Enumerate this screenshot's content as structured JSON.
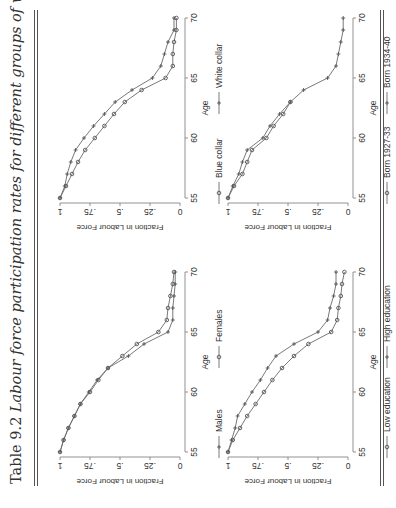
{
  "title": {
    "number": "Table 9.2",
    "caption": "Labour force participation rates for different groups of workers"
  },
  "colors": {
    "line": "#6a6a6a",
    "marker": "#555555",
    "axis": "#777777",
    "text": "#333333"
  },
  "chart_data": [
    {
      "id": "gender",
      "type": "line",
      "title": "",
      "xlabel": "Age",
      "ylabel": "Fraction in Labour Force",
      "x": [
        55,
        56,
        57,
        58,
        59,
        60,
        61,
        62,
        63,
        64,
        65,
        66,
        67,
        68,
        69,
        70
      ],
      "xticks": [
        55,
        60,
        65,
        70
      ],
      "yticks": [
        0,
        0.25,
        0.5,
        0.75,
        1
      ],
      "ytick_labels": [
        "0",
        ".25",
        ".5",
        ".75",
        "1"
      ],
      "ylim": [
        0,
        1
      ],
      "legend_position": "bottom",
      "series": [
        {
          "name": "Males",
          "marker": "cross",
          "values": [
            1.0,
            0.97,
            0.93,
            0.88,
            0.83,
            0.76,
            0.69,
            0.6,
            0.43,
            0.3,
            0.1,
            0.06,
            0.06,
            0.05,
            0.04,
            0.04
          ]
        },
        {
          "name": "Females",
          "marker": "circle",
          "values": [
            1.0,
            0.97,
            0.93,
            0.88,
            0.83,
            0.75,
            0.68,
            0.6,
            0.48,
            0.36,
            0.18,
            0.11,
            0.1,
            0.08,
            0.06,
            0.05
          ]
        }
      ]
    },
    {
      "id": "education",
      "type": "line",
      "title": "",
      "xlabel": "Age",
      "ylabel": "Fraction in Labour Force",
      "x": [
        55,
        56,
        57,
        58,
        59,
        60,
        61,
        62,
        63,
        64,
        65,
        66,
        67,
        68,
        69,
        70
      ],
      "xticks": [
        55,
        60,
        65,
        70
      ],
      "yticks": [
        0,
        0.25,
        0.5,
        0.75,
        1
      ],
      "ytick_labels": [
        "0",
        ".25",
        ".5",
        ".75",
        "1"
      ],
      "ylim": [
        0,
        1
      ],
      "legend_position": "bottom",
      "series": [
        {
          "name": "Low education",
          "marker": "circle",
          "values": [
            1.0,
            0.96,
            0.9,
            0.84,
            0.77,
            0.7,
            0.63,
            0.55,
            0.45,
            0.33,
            0.14,
            0.09,
            0.08,
            0.06,
            0.05,
            0.03
          ]
        },
        {
          "name": "High education",
          "marker": "cross",
          "values": [
            1.0,
            0.97,
            0.94,
            0.92,
            0.86,
            0.8,
            0.73,
            0.67,
            0.6,
            0.45,
            0.25,
            0.17,
            0.15,
            0.12,
            0.1,
            0.1
          ]
        }
      ]
    },
    {
      "id": "occupation",
      "type": "line",
      "title": "",
      "xlabel": "Age",
      "ylabel": "Fraction in Labour Force",
      "x": [
        55,
        56,
        57,
        58,
        59,
        60,
        61,
        62,
        63,
        64,
        65,
        66,
        67,
        68,
        69,
        70
      ],
      "xticks": [
        55,
        60,
        65,
        70
      ],
      "yticks": [
        0,
        0.25,
        0.5,
        0.75,
        1
      ],
      "ytick_labels": [
        "0",
        ".25",
        ".5",
        ".75",
        "1"
      ],
      "ylim": [
        0,
        1
      ],
      "legend_position": "bottom",
      "series": [
        {
          "name": "Blue collar",
          "marker": "circle",
          "values": [
            1.0,
            0.95,
            0.9,
            0.85,
            0.79,
            0.71,
            0.63,
            0.55,
            0.46,
            0.32,
            0.12,
            0.06,
            0.06,
            0.05,
            0.03,
            0.03
          ]
        },
        {
          "name": "White collar",
          "marker": "cross",
          "values": [
            1.0,
            0.96,
            0.94,
            0.91,
            0.87,
            0.8,
            0.72,
            0.63,
            0.54,
            0.4,
            0.23,
            0.16,
            0.13,
            0.1,
            0.05,
            0.05
          ]
        }
      ]
    },
    {
      "id": "cohort",
      "type": "line",
      "title": "",
      "xlabel": "Age",
      "ylabel": "Fraction in Labour Force",
      "x": [
        55,
        56,
        57,
        58,
        59,
        60,
        61,
        62,
        63,
        64,
        65,
        66,
        67,
        68,
        69,
        70
      ],
      "xticks": [
        55,
        60,
        65,
        70
      ],
      "yticks": [
        0,
        0.25,
        0.5,
        0.75,
        1
      ],
      "ytick_labels": [
        "0",
        ".25",
        ".5",
        ".75",
        "1"
      ],
      "ylim": [
        0,
        1
      ],
      "legend_position": "bottom",
      "series": [
        {
          "name": "Born 1927-33",
          "marker": "circle",
          "values": [
            1.0,
            0.95,
            0.88,
            0.84,
            0.8,
            0.68,
            0.62,
            0.54,
            0.48,
            null,
            null,
            null,
            null,
            null,
            null,
            null
          ]
        },
        {
          "name": "Born 1934-40",
          "marker": "cross",
          "values": [
            1.0,
            0.96,
            0.91,
            0.88,
            0.84,
            0.71,
            0.65,
            0.57,
            0.48,
            0.37,
            0.17,
            0.1,
            0.08,
            0.06,
            0.04,
            0.04
          ]
        }
      ]
    }
  ]
}
